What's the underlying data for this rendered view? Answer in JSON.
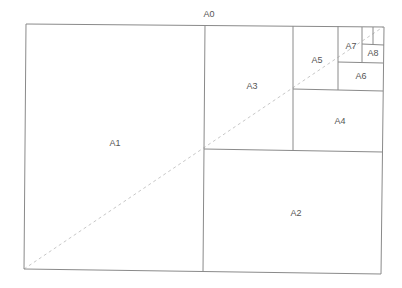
{
  "title": "A0",
  "colors": {
    "line": "#8a8a8a",
    "diagonal": "#c8c8c8",
    "text": "#555555",
    "background": "#ffffff"
  },
  "sheets": [
    {
      "label": "A1",
      "x": 115,
      "y": 143
    },
    {
      "label": "A2",
      "x": 296,
      "y": 213
    },
    {
      "label": "A3",
      "x": 252,
      "y": 86
    },
    {
      "label": "A4",
      "x": 340,
      "y": 121
    },
    {
      "label": "A5",
      "x": 317,
      "y": 60
    },
    {
      "label": "A6",
      "x": 361,
      "y": 76
    },
    {
      "label": "A7",
      "x": 351,
      "y": 46
    },
    {
      "label": "A8",
      "x": 373,
      "y": 53
    }
  ]
}
